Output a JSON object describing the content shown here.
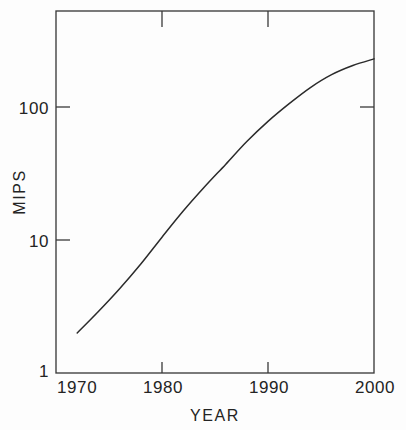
{
  "chart_data": {
    "type": "line",
    "title": "",
    "subtitle": "",
    "xlabel": "YEAR",
    "ylabel": "MIPS",
    "xlim": [
      1970,
      2000
    ],
    "ylim": [
      1,
      300
    ],
    "yscale": "log",
    "xscale": "linear",
    "grid": false,
    "legend": null,
    "legend_position": "none",
    "annotations": [],
    "x_ticks": [
      {
        "value": 1970,
        "label": "1970"
      },
      {
        "value": 1980,
        "label": "1980"
      },
      {
        "value": 1990,
        "label": "1990"
      },
      {
        "value": 2000,
        "label": "2000"
      }
    ],
    "y_ticks": [
      {
        "value": 1,
        "label": "1"
      },
      {
        "value": 10,
        "label": "10"
      },
      {
        "value": 100,
        "label": "100"
      }
    ],
    "series": [
      {
        "name": "MIPS",
        "x": [
          1972,
          1974,
          1976,
          1978,
          1980,
          1982,
          1984,
          1986,
          1988,
          1990,
          1992,
          1994,
          1996,
          1998,
          2000
        ],
        "y": [
          2.0,
          2.9,
          4.3,
          6.6,
          10.5,
          16.5,
          25,
          37,
          55,
          78,
          106,
          140,
          175,
          205,
          230
        ]
      }
    ]
  },
  "axes": {
    "y_axis_label": "MIPS",
    "x_axis_label": "YEAR"
  }
}
